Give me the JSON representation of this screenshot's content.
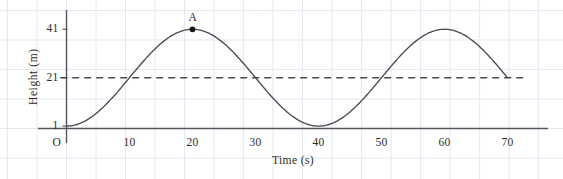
{
  "chart_data": {
    "type": "line",
    "title": "",
    "xlabel": "Time (s)",
    "ylabel": "Height (m)",
    "xlim": [
      -2,
      75
    ],
    "ylim": [
      -4,
      48
    ],
    "grid": true,
    "legend": null,
    "x_ticks": [
      10,
      20,
      30,
      40,
      50,
      60,
      70
    ],
    "x_tick_labels": [
      "10",
      "20",
      "30",
      "40",
      "50",
      "60",
      "70"
    ],
    "y_ticks": [
      1,
      21,
      41
    ],
    "y_tick_labels": [
      "1",
      "21",
      "41"
    ],
    "origin_label": "O",
    "series": [
      {
        "name": "height",
        "kind": "sinusoid",
        "equation": "h = 21 - 20*cos(2*pi*t/40)",
        "midline": 21,
        "amplitude": 20,
        "period": 40,
        "minimum": 1,
        "maximum": 41,
        "x_start": 0,
        "x_end": 70,
        "x": [
          0,
          2,
          4,
          6,
          8,
          10,
          12,
          14,
          16,
          18,
          20,
          22,
          24,
          26,
          28,
          30,
          32,
          34,
          36,
          38,
          40,
          42,
          44,
          46,
          48,
          50,
          52,
          54,
          56,
          58,
          60,
          62,
          64,
          66,
          68,
          70
        ],
        "values": [
          1,
          1.5,
          3.0,
          5.4,
          8.7,
          12.7,
          17.2,
          22.0,
          26.8,
          31.4,
          35.4,
          38.7,
          41.0,
          41.0,
          41.0,
          41.0,
          38.7,
          35.4,
          31.4,
          26.8,
          22.0,
          17.2,
          12.7,
          8.7,
          5.4,
          3.0,
          1.5,
          1.0,
          1.5,
          3.0,
          5.4,
          8.7,
          12.7,
          17.2,
          22.0,
          26.8
        ]
      }
    ],
    "reference_lines": [
      {
        "name": "midline",
        "orientation": "horizontal",
        "value": 21,
        "style": "dashed",
        "x_from": -1,
        "x_to": 73
      }
    ],
    "annotations": [
      {
        "name": "point-a",
        "label": "A",
        "x": 20,
        "y": 41,
        "marker": "filled-circle",
        "label_position": "above"
      }
    ],
    "colors": {
      "curve": "#4a4a52",
      "axis": "#555560",
      "grid": "#dfe6ee",
      "dashed": "#4a4a52",
      "text": "#2b2b2b",
      "background": "#ffffff"
    }
  }
}
